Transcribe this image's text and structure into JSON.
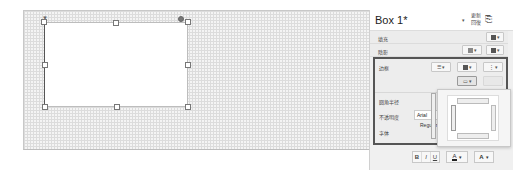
{
  "canvas": {
    "shape_name": "Box 1"
  },
  "panel": {
    "title": "Box 1*",
    "more_label_line1": "更新",
    "more_label_line2": "回復",
    "rows": {
      "fill": "填充",
      "shadow": "陰影",
      "border": "边框",
      "corner_radius": "圆角半径",
      "opacity": "不透明度",
      "font": "字体"
    },
    "font_value": "Arial",
    "font_style": "Regular",
    "toolbar": {
      "bold": "B",
      "italic": "I",
      "underline": "U",
      "text_color": "A",
      "font_color": "A"
    },
    "dropdown_arrow": "▾"
  },
  "colors": {
    "section_border": "#555555",
    "panel_bg": "#f0f0f0"
  }
}
